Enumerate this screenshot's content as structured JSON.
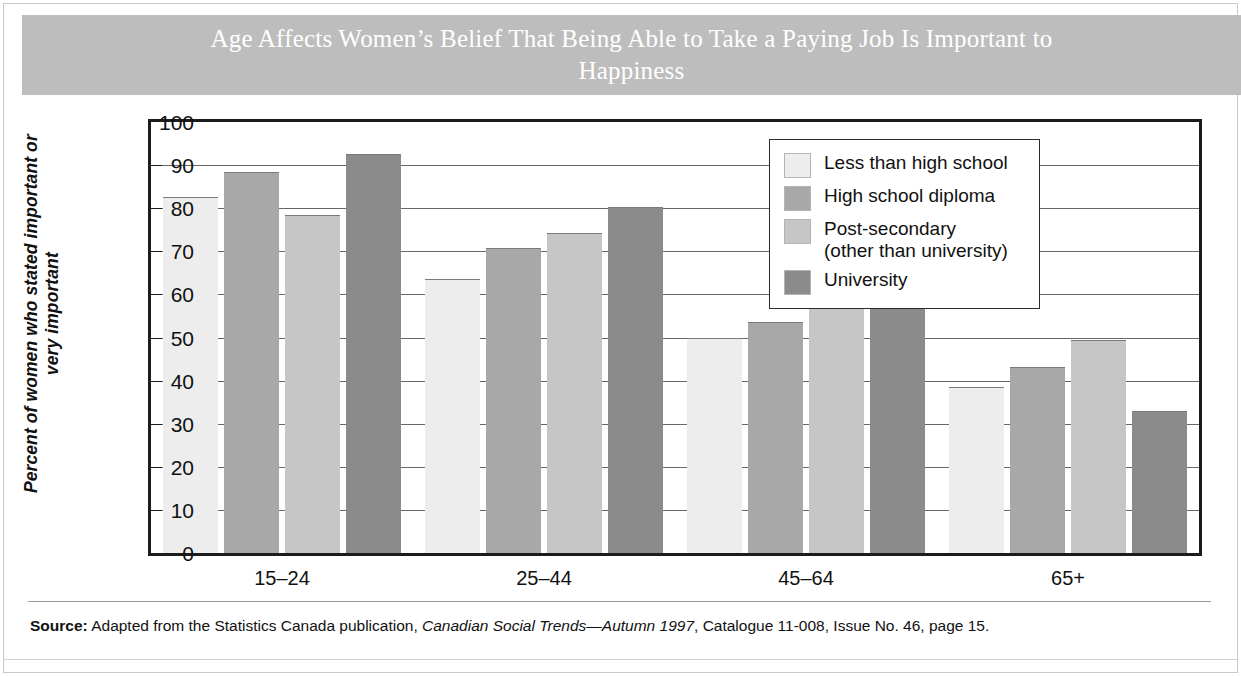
{
  "title": "Age Affects Women’s Belief That Being Able to Take a Paying\nJob Is Important to Happiness",
  "source": {
    "label": "Source:",
    "text_before_italic": "Adapted from the Statistics Canada publication, ",
    "italic_text": "Canadian Social Trends—Autumn 1997",
    "text_after_italic": ", Catalogue 11-008, Issue No. 46, page 15."
  },
  "colors": {
    "title_band": "#bdbdbd",
    "title_text": "#ffffff",
    "axis": "#1c1c1c",
    "gridline": "#676767",
    "series_1": "#ededed",
    "series_2": "#a8a8a8",
    "series_3": "#c6c6c6",
    "series_4": "#8b8b8b"
  },
  "chart_data": {
    "type": "bar",
    "title": "Age Affects Women’s Belief That Being Able to Take a Paying Job Is Important to Happiness",
    "xlabel": "",
    "ylabel": "Percent of women who stated\nimportant or very important",
    "ylim": [
      0,
      100
    ],
    "yticks": [
      0,
      10,
      20,
      30,
      40,
      50,
      60,
      70,
      80,
      90,
      100
    ],
    "ytick_labels": [
      "0",
      "10",
      "20",
      "30",
      "40",
      "50",
      "60",
      "70",
      "80",
      "90",
      "100"
    ],
    "grid": true,
    "legend_position": "top-right",
    "categories": [
      "15–24",
      "25–44",
      "45–64",
      "65+"
    ],
    "series": [
      {
        "name": "Less than high school",
        "color": "#ededed",
        "values": [
          82.5,
          63.5,
          50.0,
          38.5
        ]
      },
      {
        "name": "High school diploma",
        "color": "#a8a8a8",
        "values": [
          88.5,
          70.7,
          53.5,
          43.2
        ]
      },
      {
        "name": "Post-secondary\n(other than university)",
        "color": "#c6c6c6",
        "values": [
          78.5,
          74.2,
          60.0,
          49.5
        ]
      },
      {
        "name": "University",
        "color": "#8b8b8b",
        "values": [
          92.5,
          80.3,
          76.3,
          33.0
        ]
      }
    ]
  }
}
